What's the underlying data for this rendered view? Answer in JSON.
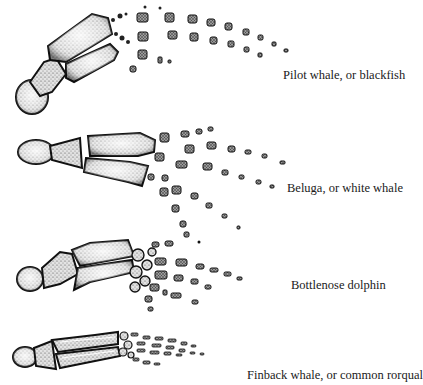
{
  "figure": {
    "panels": [
      {
        "id": "pilot",
        "label": "Pilot whale, or blackfish"
      },
      {
        "id": "beluga",
        "label": "Beluga, or white whale"
      },
      {
        "id": "bottlenose",
        "label": "Bottlenose dolphin"
      },
      {
        "id": "finback",
        "label": "Finback whale, or common rorqual"
      }
    ],
    "colors": {
      "ink": "#1a1a1a",
      "stipple_light": "#cfcfcf",
      "background": "#ffffff"
    }
  }
}
